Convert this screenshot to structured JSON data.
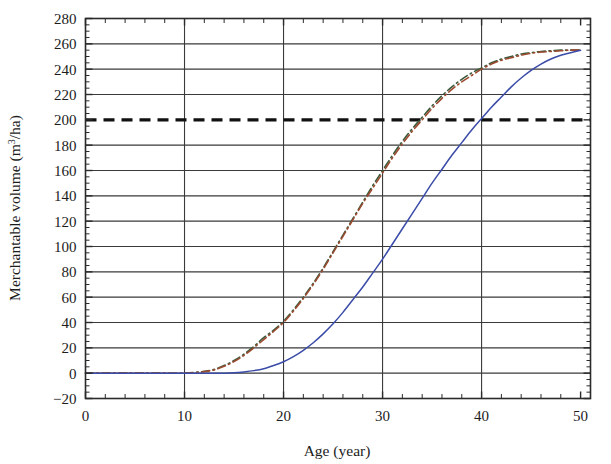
{
  "figure": {
    "background_color": "#ffffff",
    "axis_color": "#2b2b2b",
    "grid_color": "#3a3a3a"
  },
  "chart_data": {
    "type": "line",
    "title": "",
    "xlabel": "Age (year)",
    "ylabel_parts": {
      "main": "Merchantable volume (m",
      "superscript": "3",
      "tail": "/ha)"
    },
    "ylabel": "Merchantable volume (m3/ha)",
    "xlim": [
      0,
      51
    ],
    "ylim": [
      -20,
      280
    ],
    "xticks": [
      0,
      10,
      20,
      30,
      40,
      50
    ],
    "xtick_labels": [
      "0",
      "10",
      "20",
      "30",
      "40",
      "50"
    ],
    "x_minor_tick_step": 2,
    "yticks": [
      -20,
      0,
      20,
      40,
      60,
      80,
      100,
      120,
      140,
      160,
      180,
      200,
      220,
      240,
      260,
      280
    ],
    "ytick_labels": [
      "-20",
      "0",
      "20",
      "40",
      "60",
      "80",
      "100",
      "120",
      "140",
      "160",
      "180",
      "200",
      "220",
      "240",
      "260",
      "280"
    ],
    "y_minor_tick_step": 5,
    "grid": {
      "horizontal": true,
      "vertical": true,
      "horizontal_at": [
        0,
        20,
        40,
        60,
        80,
        100,
        120,
        140,
        160,
        180,
        220,
        240,
        260
      ],
      "vertical_at": [
        10,
        20,
        30,
        40
      ]
    },
    "legend": {
      "visible": false,
      "position": "none"
    },
    "x": [
      0,
      2,
      4,
      6,
      8,
      10,
      11,
      12,
      13,
      14,
      15,
      16,
      17,
      18,
      19,
      20,
      21,
      22,
      23,
      24,
      25,
      26,
      27,
      28,
      29,
      30,
      31,
      32,
      33,
      34,
      35,
      36,
      37,
      38,
      39,
      40,
      41,
      42,
      43,
      44,
      45,
      46,
      47,
      48,
      49,
      50
    ],
    "series": [
      {
        "name": "curve-green-dashdot",
        "color": "#3c5a3c",
        "style": "dash-dot",
        "width": 1.6,
        "values": [
          0,
          0,
          0,
          0,
          0,
          0,
          0.5,
          1.5,
          3,
          6,
          10,
          15,
          21,
          28,
          34,
          41,
          50,
          60,
          71,
          83,
          96,
          109,
          122,
          135,
          148,
          160,
          172,
          183,
          193,
          202,
          211,
          219,
          226,
          232,
          237,
          241,
          245,
          248,
          250,
          252,
          253,
          254,
          254.5,
          255,
          255,
          255
        ]
      },
      {
        "name": "curve-red-dashdot",
        "color": "#9c4a2f",
        "style": "dash-dot",
        "width": 1.6,
        "values": [
          0,
          0,
          0,
          0,
          0,
          0,
          0.4,
          1.2,
          2.6,
          5.4,
          9.2,
          14,
          20,
          26.5,
          33,
          40,
          49,
          59,
          70,
          82,
          95,
          108,
          121,
          134,
          146,
          158,
          170,
          181,
          191,
          200,
          209,
          217,
          224,
          230,
          235,
          240,
          244,
          247,
          249,
          251,
          252.5,
          253.5,
          254,
          254.5,
          255,
          255
        ]
      },
      {
        "name": "curve-blue-solid",
        "color": "#3b4ba8",
        "style": "solid",
        "width": 1.5,
        "values": [
          0,
          0,
          0,
          0,
          0,
          0,
          0,
          0,
          0,
          0,
          0.3,
          1,
          2,
          3.5,
          6,
          9,
          13,
          18,
          24,
          31,
          39,
          48,
          58,
          68,
          79,
          90,
          102,
          114,
          126,
          138,
          150,
          161,
          172,
          182,
          192,
          201,
          210,
          218,
          226,
          233,
          239,
          244,
          248,
          251,
          253,
          255
        ]
      }
    ],
    "reference_lines": [
      {
        "name": "threshold-200",
        "orientation": "horizontal",
        "value": 200,
        "color": "#111111",
        "style": "dashed",
        "width": 3.2,
        "label": ""
      }
    ]
  }
}
